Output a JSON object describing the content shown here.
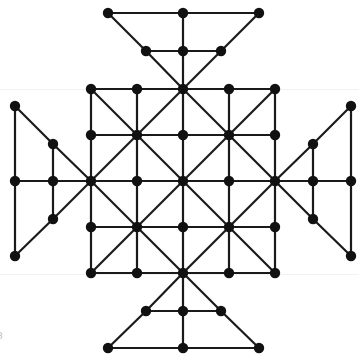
{
  "figure": {
    "background_color": "#ffffff",
    "edge_color": "#1a1a1a",
    "node_color": "#111111",
    "edge_width": 2.2,
    "node_radius": 5.2,
    "canvas": {
      "width": 359,
      "height": 360
    },
    "corner_label": "8",
    "corner_label_color": "#b9b9b9"
  },
  "chart_data": {
    "type": "diagram",
    "xlabel": "",
    "ylabel": "",
    "xlim": [
      0,
      359
    ],
    "ylim": [
      0,
      360
    ],
    "grid": false,
    "legend": "none",
    "node_count": 49,
    "edge_count": 92,
    "geometry": {
      "center": [
        183,
        181
      ],
      "grid_spacing": 46,
      "grid_columns": [
        91,
        137,
        183,
        229,
        275
      ],
      "grid_rows": [
        89,
        135,
        181,
        227,
        273
      ],
      "wing_inner_offset": 38,
      "wing_outer_offset": 76
    },
    "nodes": [
      {
        "id": "g00",
        "x": 91,
        "y": 89,
        "group": "core"
      },
      {
        "id": "g10",
        "x": 137,
        "y": 89,
        "group": "core"
      },
      {
        "id": "g20",
        "x": 183,
        "y": 89,
        "group": "core"
      },
      {
        "id": "g30",
        "x": 229,
        "y": 89,
        "group": "core"
      },
      {
        "id": "g40",
        "x": 275,
        "y": 89,
        "group": "core"
      },
      {
        "id": "g01",
        "x": 91,
        "y": 135,
        "group": "core"
      },
      {
        "id": "g11",
        "x": 137,
        "y": 135,
        "group": "core"
      },
      {
        "id": "g21",
        "x": 183,
        "y": 135,
        "group": "core"
      },
      {
        "id": "g31",
        "x": 229,
        "y": 135,
        "group": "core"
      },
      {
        "id": "g41",
        "x": 275,
        "y": 135,
        "group": "core"
      },
      {
        "id": "g02",
        "x": 91,
        "y": 181,
        "group": "core"
      },
      {
        "id": "g12",
        "x": 137,
        "y": 181,
        "group": "core"
      },
      {
        "id": "g22",
        "x": 183,
        "y": 181,
        "group": "core"
      },
      {
        "id": "g32",
        "x": 229,
        "y": 181,
        "group": "core"
      },
      {
        "id": "g42",
        "x": 275,
        "y": 181,
        "group": "core"
      },
      {
        "id": "g03",
        "x": 91,
        "y": 227,
        "group": "core"
      },
      {
        "id": "g13",
        "x": 137,
        "y": 227,
        "group": "core"
      },
      {
        "id": "g23",
        "x": 183,
        "y": 227,
        "group": "core"
      },
      {
        "id": "g33",
        "x": 229,
        "y": 227,
        "group": "core"
      },
      {
        "id": "g43",
        "x": 275,
        "y": 227,
        "group": "core"
      },
      {
        "id": "g04",
        "x": 91,
        "y": 273,
        "group": "core"
      },
      {
        "id": "g14",
        "x": 137,
        "y": 273,
        "group": "core"
      },
      {
        "id": "g24",
        "x": 183,
        "y": 273,
        "group": "core"
      },
      {
        "id": "g34",
        "x": 229,
        "y": 273,
        "group": "core"
      },
      {
        "id": "g44",
        "x": 275,
        "y": 273,
        "group": "core"
      },
      {
        "id": "tI_l",
        "x": 146,
        "y": 51,
        "group": "wing-top-inner"
      },
      {
        "id": "tI_c",
        "x": 183,
        "y": 51,
        "group": "wing-top-inner"
      },
      {
        "id": "tI_r",
        "x": 221,
        "y": 51,
        "group": "wing-top-inner"
      },
      {
        "id": "tO_l",
        "x": 108,
        "y": 13,
        "group": "wing-top-outer"
      },
      {
        "id": "tO_c",
        "x": 183,
        "y": 13,
        "group": "wing-top-outer"
      },
      {
        "id": "tO_r",
        "x": 259,
        "y": 13,
        "group": "wing-top-outer"
      },
      {
        "id": "bI_l",
        "x": 146,
        "y": 311,
        "group": "wing-bottom-inner"
      },
      {
        "id": "bI_c",
        "x": 183,
        "y": 311,
        "group": "wing-bottom-inner"
      },
      {
        "id": "bI_r",
        "x": 221,
        "y": 311,
        "group": "wing-bottom-inner"
      },
      {
        "id": "bO_l",
        "x": 108,
        "y": 348,
        "group": "wing-bottom-outer"
      },
      {
        "id": "bO_c",
        "x": 183,
        "y": 348,
        "group": "wing-bottom-outer"
      },
      {
        "id": "bO_r",
        "x": 259,
        "y": 348,
        "group": "wing-bottom-outer"
      },
      {
        "id": "lI_t",
        "x": 53,
        "y": 144,
        "group": "wing-left-inner"
      },
      {
        "id": "lI_c",
        "x": 53,
        "y": 181,
        "group": "wing-left-inner"
      },
      {
        "id": "lI_b",
        "x": 53,
        "y": 219,
        "group": "wing-left-inner"
      },
      {
        "id": "lO_t",
        "x": 15,
        "y": 106,
        "group": "wing-left-outer"
      },
      {
        "id": "lO_c",
        "x": 15,
        "y": 181,
        "group": "wing-left-outer"
      },
      {
        "id": "lO_b",
        "x": 15,
        "y": 256,
        "group": "wing-left-outer"
      },
      {
        "id": "rI_t",
        "x": 313,
        "y": 144,
        "group": "wing-right-inner"
      },
      {
        "id": "rI_c",
        "x": 313,
        "y": 181,
        "group": "wing-right-inner"
      },
      {
        "id": "rI_b",
        "x": 313,
        "y": 219,
        "group": "wing-right-inner"
      },
      {
        "id": "rO_t",
        "x": 351,
        "y": 106,
        "group": "wing-right-outer"
      },
      {
        "id": "rO_c",
        "x": 351,
        "y": 181,
        "group": "wing-right-outer"
      },
      {
        "id": "rO_b",
        "x": 351,
        "y": 256,
        "group": "wing-right-outer"
      }
    ],
    "edges": [
      [
        "g00",
        "g10"
      ],
      [
        "g10",
        "g20"
      ],
      [
        "g20",
        "g30"
      ],
      [
        "g30",
        "g40"
      ],
      [
        "g01",
        "g11"
      ],
      [
        "g11",
        "g21"
      ],
      [
        "g21",
        "g31"
      ],
      [
        "g31",
        "g41"
      ],
      [
        "g02",
        "g12"
      ],
      [
        "g12",
        "g22"
      ],
      [
        "g22",
        "g32"
      ],
      [
        "g32",
        "g42"
      ],
      [
        "g03",
        "g13"
      ],
      [
        "g13",
        "g23"
      ],
      [
        "g23",
        "g33"
      ],
      [
        "g33",
        "g43"
      ],
      [
        "g04",
        "g14"
      ],
      [
        "g14",
        "g24"
      ],
      [
        "g24",
        "g34"
      ],
      [
        "g34",
        "g44"
      ],
      [
        "g00",
        "g01"
      ],
      [
        "g01",
        "g02"
      ],
      [
        "g02",
        "g03"
      ],
      [
        "g03",
        "g04"
      ],
      [
        "g10",
        "g11"
      ],
      [
        "g11",
        "g12"
      ],
      [
        "g12",
        "g13"
      ],
      [
        "g13",
        "g14"
      ],
      [
        "g20",
        "g21"
      ],
      [
        "g21",
        "g22"
      ],
      [
        "g22",
        "g23"
      ],
      [
        "g23",
        "g24"
      ],
      [
        "g30",
        "g31"
      ],
      [
        "g31",
        "g32"
      ],
      [
        "g32",
        "g33"
      ],
      [
        "g33",
        "g34"
      ],
      [
        "g40",
        "g41"
      ],
      [
        "g41",
        "g42"
      ],
      [
        "g42",
        "g43"
      ],
      [
        "g43",
        "g44"
      ],
      [
        "g00",
        "g11"
      ],
      [
        "g11",
        "g22"
      ],
      [
        "g22",
        "g33"
      ],
      [
        "g33",
        "g44"
      ],
      [
        "g20",
        "g11"
      ],
      [
        "g11",
        "g02"
      ],
      [
        "g40",
        "g31"
      ],
      [
        "g31",
        "g22"
      ],
      [
        "g22",
        "g13"
      ],
      [
        "g13",
        "g04"
      ],
      [
        "g42",
        "g33"
      ],
      [
        "g33",
        "g24"
      ],
      [
        "g02",
        "g13"
      ],
      [
        "g13",
        "g24"
      ],
      [
        "g20",
        "g31"
      ],
      [
        "g31",
        "g42"
      ],
      [
        "g22",
        "g11"
      ],
      [
        "g22",
        "g31"
      ],
      [
        "g22",
        "g13"
      ],
      [
        "g22",
        "g33"
      ],
      [
        "g20",
        "tI_c"
      ],
      [
        "tI_c",
        "tO_c"
      ],
      [
        "tI_l",
        "tI_c"
      ],
      [
        "tI_c",
        "tI_r"
      ],
      [
        "tO_l",
        "tO_c"
      ],
      [
        "tO_c",
        "tO_r"
      ],
      [
        "g20",
        "tI_l"
      ],
      [
        "tI_l",
        "tO_l"
      ],
      [
        "g20",
        "tI_r"
      ],
      [
        "tI_r",
        "tO_r"
      ],
      [
        "g24",
        "bI_c"
      ],
      [
        "bI_c",
        "bO_c"
      ],
      [
        "bI_l",
        "bI_c"
      ],
      [
        "bI_c",
        "bI_r"
      ],
      [
        "bO_l",
        "bO_c"
      ],
      [
        "bO_c",
        "bO_r"
      ],
      [
        "g24",
        "bI_l"
      ],
      [
        "bI_l",
        "bO_l"
      ],
      [
        "g24",
        "bI_r"
      ],
      [
        "bI_r",
        "bO_r"
      ],
      [
        "g02",
        "lI_c"
      ],
      [
        "lI_c",
        "lO_c"
      ],
      [
        "lI_t",
        "lI_c"
      ],
      [
        "lI_c",
        "lI_b"
      ],
      [
        "lO_t",
        "lO_c"
      ],
      [
        "lO_c",
        "lO_b"
      ],
      [
        "g02",
        "lI_t"
      ],
      [
        "lI_t",
        "lO_t"
      ],
      [
        "g02",
        "lI_b"
      ],
      [
        "lI_b",
        "lO_b"
      ],
      [
        "g42",
        "rI_c"
      ],
      [
        "rI_c",
        "rO_c"
      ],
      [
        "rI_t",
        "rI_c"
      ],
      [
        "rI_c",
        "rI_b"
      ],
      [
        "rO_t",
        "rO_c"
      ],
      [
        "rO_c",
        "rO_b"
      ],
      [
        "g42",
        "rI_t"
      ],
      [
        "rI_t",
        "rO_t"
      ],
      [
        "g42",
        "rI_b"
      ],
      [
        "rI_b",
        "rO_b"
      ]
    ]
  }
}
